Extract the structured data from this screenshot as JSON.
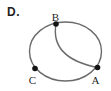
{
  "figure": {
    "label": "D.",
    "kind": "geometry-diagram"
  },
  "diagram": {
    "points": [
      {
        "id": "B",
        "label": "B"
      },
      {
        "id": "C",
        "label": "C"
      },
      {
        "id": "A",
        "label": "A"
      }
    ],
    "colors": {
      "stroke": "#6b6b6b",
      "dot": "#141414",
      "text": "#1f1f1f",
      "background": "#ffffff"
    }
  }
}
